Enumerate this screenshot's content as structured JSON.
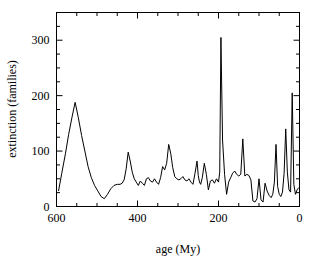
{
  "figure": {
    "background_color": "#ffffff",
    "frame_color": "#000000",
    "line_color": "#000000"
  },
  "axes": {
    "x_title": "age (My)",
    "y_title": "extinction (families)",
    "x_ticks": [
      "600",
      "400",
      "200",
      "0"
    ],
    "y_ticks": [
      "0",
      "100",
      "200",
      "300"
    ]
  },
  "chart_data": {
    "type": "line",
    "title": "",
    "xlabel": "age (My)",
    "ylabel": "extinction (families)",
    "xlim": [
      600,
      0
    ],
    "ylim": [
      0,
      350
    ],
    "x_reversed": true,
    "grid": false,
    "legend": "none",
    "x_major_ticks": [
      600,
      400,
      200,
      0
    ],
    "x_minor_ticks": [
      550,
      500,
      450,
      350,
      300,
      250,
      150,
      100,
      50
    ],
    "y_major_ticks": [
      0,
      100,
      200,
      300
    ],
    "y_minor_ticks": [
      25,
      50,
      75,
      125,
      150,
      175,
      225,
      250,
      275,
      325,
      350
    ],
    "series": [
      {
        "name": "extinction (families)",
        "color": "#000000",
        "x": [
          595,
          587,
          578,
          570,
          562,
          554,
          546,
          538,
          530,
          522,
          514,
          506,
          498,
          490,
          482,
          474,
          466,
          458,
          450,
          443,
          438,
          433,
          428,
          423,
          418,
          413,
          408,
          403,
          398,
          393,
          388,
          383,
          378,
          373,
          368,
          363,
          358,
          353,
          348,
          343,
          338,
          333,
          328,
          323,
          318,
          313,
          308,
          303,
          298,
          293,
          288,
          283,
          278,
          273,
          268,
          263,
          258,
          253,
          250,
          247,
          244,
          240,
          235,
          230,
          225,
          220,
          215,
          210,
          205,
          200,
          197,
          194,
          190,
          185,
          180,
          175,
          170,
          165,
          160,
          155,
          150,
          145,
          140,
          135,
          130,
          125,
          120,
          115,
          110,
          105,
          100,
          95,
          90,
          85,
          80,
          75,
          70,
          66,
          62,
          58,
          54,
          50,
          46,
          42,
          38,
          34,
          30,
          26,
          22,
          18,
          14,
          10,
          6,
          2
        ],
        "y": [
          28,
          60,
          95,
          130,
          160,
          188,
          160,
          128,
          100,
          72,
          52,
          38,
          28,
          18,
          14,
          22,
          32,
          38,
          40,
          40,
          42,
          48,
          68,
          98,
          82,
          62,
          50,
          44,
          38,
          46,
          42,
          38,
          50,
          52,
          46,
          44,
          50,
          44,
          40,
          52,
          72,
          66,
          78,
          112,
          96,
          70,
          54,
          50,
          48,
          50,
          54,
          48,
          46,
          50,
          44,
          40,
          60,
          82,
          56,
          44,
          40,
          52,
          78,
          58,
          30,
          46,
          48,
          42,
          50,
          44,
          62,
          305,
          120,
          58,
          22,
          44,
          52,
          60,
          64,
          58,
          55,
          58,
          122,
          55,
          58,
          56,
          48,
          10,
          8,
          14,
          50,
          12,
          8,
          42,
          28,
          20,
          16,
          22,
          44,
          112,
          36,
          22,
          18,
          26,
          60,
          140,
          62,
          30,
          26,
          205,
          40,
          22,
          30,
          34
        ],
        "note_peaks": [
          {
            "x": 554,
            "y": 188,
            "label": "late Cambrian"
          },
          {
            "x": 194,
            "y": 305,
            "label": "end-Permian"
          },
          {
            "x": 18,
            "y": 205,
            "label": "end-Cretaceous"
          }
        ]
      }
    ]
  }
}
